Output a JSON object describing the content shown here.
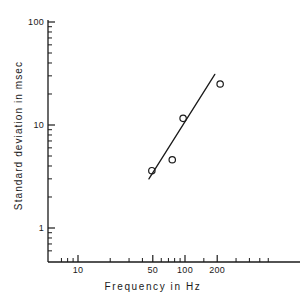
{
  "chart_data": {
    "type": "scatter",
    "title": "",
    "subtitle": "",
    "xlabel": "Frequency  in  Hz",
    "ylabel": "Standard  deviation  in  msec",
    "xscale": "log",
    "yscale": "log",
    "xlim": [
      6,
      600
    ],
    "ylim": [
      0.55,
      100
    ],
    "grid": false,
    "legend": null,
    "marker": "open-circle",
    "x": [
      49,
      76,
      96,
      213
    ],
    "y": [
      3.6,
      4.6,
      11.6,
      25.0
    ],
    "series": [
      {
        "name": "measurements",
        "points": [
          {
            "x": 49,
            "y": 3.6
          },
          {
            "x": 76,
            "y": 4.6
          },
          {
            "x": 96,
            "y": 11.6
          },
          {
            "x": 213,
            "y": 25.0
          }
        ]
      }
    ],
    "fit_line": {
      "name": "regression line",
      "x_start": 46,
      "y_start": 3.0,
      "x_end": 190,
      "y_end": 31.0
    },
    "xticks_labeled": [
      {
        "value": 10,
        "label": "10"
      },
      {
        "value": 50,
        "label": "50"
      },
      {
        "value": 100,
        "label": "100"
      },
      {
        "value": 200,
        "label": "200"
      }
    ],
    "xticks_minor": [
      7,
      8,
      9,
      20,
      30,
      40,
      60,
      70,
      80,
      90,
      150,
      300,
      400,
      500,
      600
    ],
    "yticks_labeled": [
      {
        "value": 100,
        "label": "100"
      },
      {
        "value": 10,
        "label": "10"
      },
      {
        "value": 1,
        "label": "1"
      }
    ],
    "yticks_minor": [
      90,
      80,
      70,
      60,
      50,
      40,
      30,
      20,
      9,
      8,
      7,
      6,
      5,
      4,
      3,
      2,
      0.9,
      0.8,
      0.7,
      0.6
    ],
    "axis_color": "#1a1a1a",
    "marker_color": "#1a1a1a",
    "line_color": "#1a1a1a",
    "background_color": "#ffffff"
  },
  "axes": {
    "x_axis_name": "Frequency  in  Hz",
    "y_axis_name": "Standard  deviation  in  msec"
  }
}
